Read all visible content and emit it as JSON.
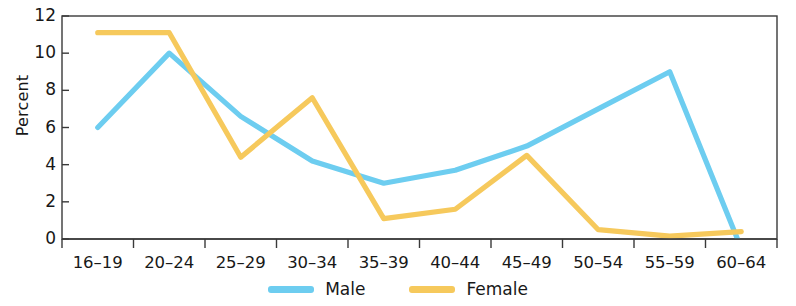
{
  "chart_data": {
    "type": "line",
    "title": "",
    "xlabel": "",
    "ylabel": "Percent",
    "categories": [
      "16–19",
      "20–24",
      "25–29",
      "30–34",
      "35–39",
      "40–44",
      "45–49",
      "50–54",
      "55–59",
      "60–64"
    ],
    "ylim": [
      0,
      12
    ],
    "yticks": [
      0,
      2,
      4,
      6,
      8,
      10,
      12
    ],
    "grid": false,
    "legend_position": "bottom",
    "series": [
      {
        "name": "Male",
        "color": "#6DCDF0",
        "values": [
          6.0,
          10.0,
          6.6,
          4.2,
          3.0,
          3.7,
          5.0,
          7.0,
          9.0,
          -0.5
        ]
      },
      {
        "name": "Female",
        "color": "#F6C95C",
        "values": [
          11.1,
          11.1,
          4.4,
          7.6,
          1.1,
          1.6,
          4.5,
          0.5,
          0.15,
          0.4
        ]
      }
    ]
  },
  "axes": {
    "y_axis_label": "Percent"
  },
  "legend": {
    "items": [
      {
        "label": "Male",
        "color": "#6DCDF0"
      },
      {
        "label": "Female",
        "color": "#F6C95C"
      }
    ]
  }
}
